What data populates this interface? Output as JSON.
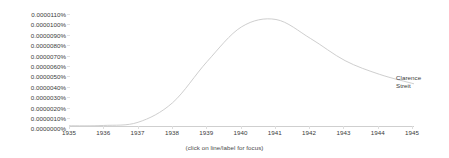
{
  "chart_data": {
    "type": "line",
    "title": "",
    "xlabel": "",
    "ylabel": "",
    "xlim": [
      1935,
      1945
    ],
    "ylim": [
      0.0,
      1.1e-05
    ],
    "grid": false,
    "legend_position": "right-of-line-end",
    "x_tick_labels": [
      "1935",
      "1936",
      "1937",
      "1938",
      "1939",
      "1940",
      "1941",
      "1942",
      "1943",
      "1944",
      "1945"
    ],
    "x": [
      1935,
      1936,
      1937,
      1938,
      1939,
      1940,
      1941,
      1942,
      1943,
      1944,
      1945
    ],
    "y_tick_labels": [
      "0.0000110%",
      "0.0000100%",
      "0.0000090%",
      "0.0000080%",
      "0.0000070%",
      "0.0000060%",
      "0.0000050%",
      "0.0000040%",
      "0.0000030%",
      "0.0000020%",
      "0.0000010%",
      "0.0000000%"
    ],
    "y_tick_values": [
      1.1e-05,
      1e-05,
      9e-06,
      8e-06,
      7e-06,
      6e-06,
      5e-06,
      4e-06,
      3e-06,
      2e-06,
      1e-06,
      0.0
    ],
    "series": [
      {
        "name": "Clarence Streit",
        "label_lines": [
          "Clarence",
          "Streit"
        ],
        "color": "#c8c8c8",
        "values": [
          2e-08,
          5e-08,
          3.5e-07,
          2.2e-06,
          6.1e-06,
          9.4e-06,
          1.01e-05,
          8.3e-06,
          6.2e-06,
          4.9e-06,
          4e-06
        ]
      }
    ]
  },
  "footer": {
    "hint": "(click on line/label for focus)"
  }
}
